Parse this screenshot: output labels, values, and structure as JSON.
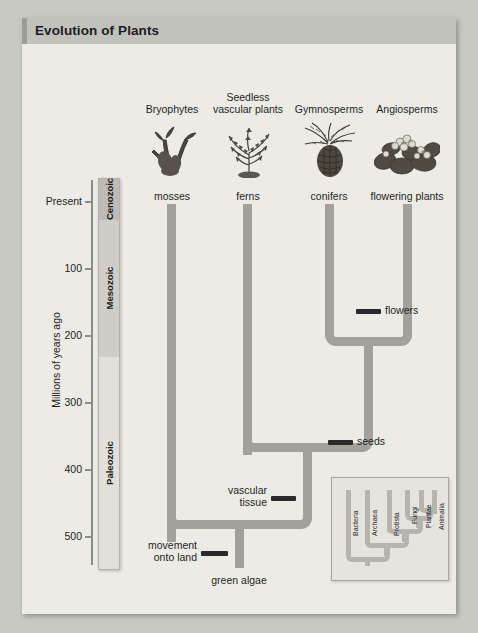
{
  "figure": {
    "title": "Evolution of Plants"
  },
  "axis": {
    "title": "Millions of years ago",
    "ticks": [
      {
        "label": "Present",
        "value": 0,
        "y": 184
      },
      {
        "label": "100",
        "value": 100,
        "y": 251
      },
      {
        "label": "200",
        "value": 200,
        "y": 318
      },
      {
        "label": "300",
        "value": 300,
        "y": 385
      },
      {
        "label": "400",
        "value": 400,
        "y": 452
      },
      {
        "label": "500",
        "value": 500,
        "y": 519
      }
    ],
    "eras": [
      {
        "label": "Cenozoic",
        "start": 0,
        "end": 65
      },
      {
        "label": "Mesozoic",
        "start": 65,
        "end": 251
      },
      {
        "label": "Paleozoic",
        "start": 251,
        "end": 542
      }
    ]
  },
  "groups": [
    {
      "formal": "Bryophytes",
      "common": "mosses",
      "icon": "moss-illustration"
    },
    {
      "formal": "Seedless\nvascular plants",
      "common": "ferns",
      "icon": "fern-illustration"
    },
    {
      "formal": "Gymnosperms",
      "common": "conifers",
      "icon": "conifer-cone-illustration"
    },
    {
      "formal": "Angiosperms",
      "common": "flowering plants",
      "icon": "flowering-plant-illustration"
    }
  ],
  "group_labels_formal": {
    "bryophytes": "Bryophytes",
    "seedless_line1": "Seedless",
    "seedless_line2": "vascular plants",
    "gymnosperms": "Gymnosperms",
    "angiosperms": "Angiosperms"
  },
  "group_labels_common": {
    "mosses": "mosses",
    "ferns": "ferns",
    "conifers": "conifers",
    "flowering_plants": "flowering plants"
  },
  "innovations": [
    {
      "name": "flowers",
      "label": "flowers",
      "age_mya": 140
    },
    {
      "name": "seeds",
      "label": "seeds",
      "age_mya": 360
    },
    {
      "name": "vascular-tissue",
      "label_line1": "vascular",
      "label_line2": "tissue",
      "age_mya": 430
    },
    {
      "name": "movement-onto-land",
      "label_line1": "movement",
      "label_line2": "onto land",
      "age_mya": 500
    }
  ],
  "root": {
    "label": "green algae"
  },
  "inset": {
    "taxa": [
      "Bacteria",
      "Archaea",
      "Protista",
      "Fungi",
      "Plantae",
      "Animalia"
    ]
  },
  "colors": {
    "page_background": "#c9c9c4",
    "card_background": "#edebe5",
    "title_bar": "#c2c2bd",
    "branch": "#a3a19b",
    "era_cenozoic": "#bdbbb5",
    "era_mesozoic": "#cfcdc7",
    "era_paleozoic": "#e2e0da",
    "tick_mark": "#2a2a2a",
    "text": "#1f1f1f"
  }
}
